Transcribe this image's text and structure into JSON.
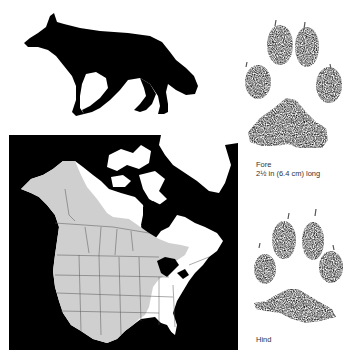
{
  "figure": {
    "silhouette_icon": "wolf-silhouette-icon",
    "map": {
      "region": "North America",
      "range_shading_color": "#cfcfcf",
      "non_range_land_color": "#ffffff",
      "water_color": "#000000",
      "border_color": "#555555"
    },
    "tracks": {
      "fore": {
        "label": "Fore",
        "size": "2½ in (6.4 cm) long",
        "icon": "fore-paw-print-icon"
      },
      "hind": {
        "label": "Hind",
        "icon": "hind-paw-print-icon"
      }
    }
  }
}
